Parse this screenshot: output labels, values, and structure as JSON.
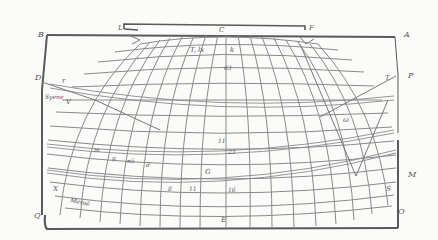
{
  "diagram": {
    "type": "map-projection-graticule",
    "colors": {
      "paper": "#fbfbf9",
      "frame": "#5a5a5a",
      "grid": "#8a8a8a",
      "ink": "#555555"
    },
    "corner_labels": {
      "top_left": "B",
      "top_right": "A",
      "bottom_left": "Q",
      "bottom_right": "O",
      "left_upper": "D",
      "right_upper": "P",
      "right_lower": "M",
      "bottom_center": "E",
      "top_center": "C",
      "top_bar_left": "L",
      "top_bar_right": "F"
    },
    "region_labels": {
      "top_inner": "T, lx",
      "top_inner_right": "k",
      "left_r": "r",
      "left_v": "V",
      "syene": "Syene",
      "right_t": "T",
      "right_omega": "ω",
      "right_s": "S",
      "left_x": "X",
      "meroe": "Meroë"
    },
    "grid_labels": {
      "n63": "63",
      "n23": "23",
      "n16": "16",
      "n11": "11",
      "n8": "8",
      "g_left": "G",
      "small_1": "m",
      "small_2": "g",
      "small_3": "n5",
      "small_4": "d",
      "small_5": "s",
      "small_6": "u"
    }
  }
}
